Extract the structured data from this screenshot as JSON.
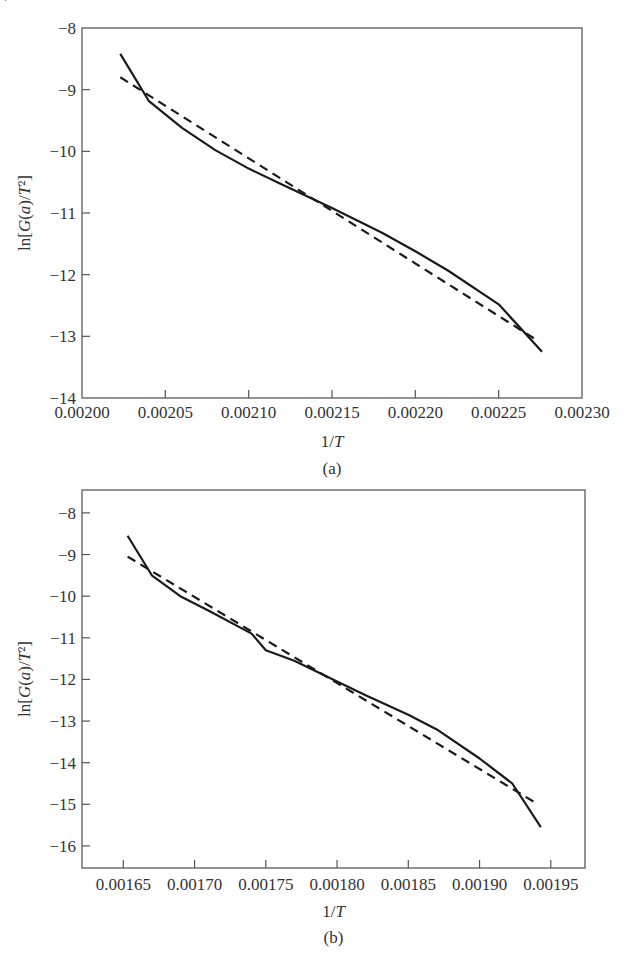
{
  "chart_data": [
    {
      "id": "a",
      "type": "line",
      "caption": "(a)",
      "title": "",
      "xlabel": "1/T",
      "ylabel": "ln[G(a)/T²]",
      "xlim": [
        0.002,
        0.0023
      ],
      "ylim": [
        -14,
        -8
      ],
      "x_ticks": [
        0.002,
        0.00205,
        0.0021,
        0.00215,
        0.0022,
        0.00225,
        0.0023
      ],
      "x_tick_labels": [
        "0.00200",
        "0.00205",
        "0.00210",
        "0.00215",
        "0.00220",
        "0.00225",
        "0.00230"
      ],
      "y_ticks": [
        -8,
        -9,
        -10,
        -11,
        -12,
        -13,
        -14
      ],
      "y_tick_labels": [
        "-8",
        "-9",
        "-10",
        "-11",
        "-12",
        "-13",
        "-14"
      ],
      "grid": false,
      "legend": null,
      "series": [
        {
          "name": "experimental",
          "style": "solid",
          "x": [
            0.002023,
            0.00204,
            0.00206,
            0.00208,
            0.0021,
            0.00212,
            0.00215,
            0.00218,
            0.0022,
            0.00222,
            0.00225,
            0.002276
          ],
          "y": [
            -8.42,
            -9.18,
            -9.62,
            -9.98,
            -10.28,
            -10.54,
            -10.92,
            -11.32,
            -11.62,
            -11.94,
            -12.48,
            -13.25
          ]
        },
        {
          "name": "linear fit",
          "style": "dashed",
          "x": [
            0.002023,
            0.002274
          ],
          "y": [
            -8.8,
            -13.08
          ]
        }
      ]
    },
    {
      "id": "b",
      "type": "line",
      "caption": "(b)",
      "title": "",
      "xlabel": "1/T",
      "ylabel": "ln[G(a)/T²]",
      "xlim": [
        0.001621,
        0.001974
      ],
      "ylim": [
        -16.53,
        -7.45
      ],
      "x_ticks": [
        0.00165,
        0.0017,
        0.00175,
        0.0018,
        0.00185,
        0.0019,
        0.00195
      ],
      "x_tick_labels": [
        "0.00165",
        "0.00170",
        "0.00175",
        "0.00180",
        "0.00185",
        "0.00190",
        "0.00195"
      ],
      "y_ticks": [
        -8,
        -9,
        -10,
        -11,
        -12,
        -13,
        -14,
        -15,
        -16
      ],
      "y_tick_labels": [
        "-8",
        "-9",
        "-10",
        "-11",
        "-12",
        "-13",
        "-14",
        "-15",
        "-16"
      ],
      "grid": false,
      "legend": null,
      "series": [
        {
          "name": "experimental",
          "style": "solid",
          "x": [
            0.001653,
            0.00167,
            0.00169,
            0.00171,
            0.00174,
            0.00175,
            0.00177,
            0.0018,
            0.00182,
            0.00185,
            0.00187,
            0.0019,
            0.001923,
            0.001943
          ],
          "y": [
            -8.55,
            -9.5,
            -10.0,
            -10.35,
            -10.9,
            -11.3,
            -11.55,
            -12.05,
            -12.38,
            -12.85,
            -13.2,
            -13.9,
            -14.5,
            -15.55
          ]
        },
        {
          "name": "linear fit",
          "style": "dashed",
          "x": [
            0.001653,
            0.001941
          ],
          "y": [
            -9.05,
            -15.0
          ]
        }
      ]
    }
  ],
  "page": {
    "corner_glyph": "'"
  }
}
